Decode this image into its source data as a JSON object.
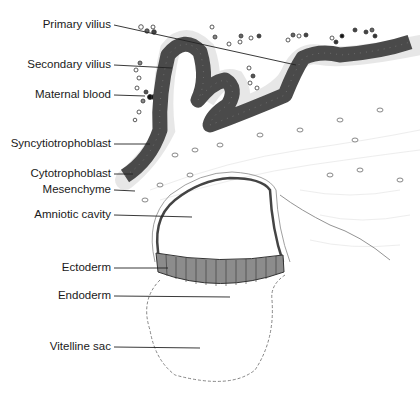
{
  "diagram": {
    "type": "anatomical-illustration",
    "colors": {
      "trophoblast_fill": "#4a4a4a",
      "ectoderm_fill": "#8c8c8c",
      "outline": "#222222",
      "background": "#ffffff",
      "cell_stroke": "#555555"
    },
    "labels": [
      {
        "id": "primary-vilius",
        "text": "Primary vilius",
        "right": 113,
        "y": 25,
        "line_to": [
          296,
          65
        ]
      },
      {
        "id": "secondary-vilius",
        "text": "Secondary vilius",
        "right": 113,
        "y": 65,
        "line_to": [
          172,
          68
        ]
      },
      {
        "id": "maternal-blood",
        "text": "Maternal blood",
        "right": 113,
        "y": 95,
        "line_to": [
          145,
          96
        ]
      },
      {
        "id": "syncytiotrophoblast",
        "text": "Syncytiotrophoblast",
        "right": 113,
        "y": 144,
        "line_to": [
          150,
          144
        ]
      },
      {
        "id": "cytotrophoblast",
        "text": "Cytotrophoblast",
        "right": 113,
        "y": 174,
        "line_to": [
          133,
          174
        ]
      },
      {
        "id": "mesenchyme",
        "text": "Mesenchyme",
        "right": 113,
        "y": 190,
        "line_to": [
          135,
          191
        ]
      },
      {
        "id": "amniotic-cavity",
        "text": "Amniotic cavity",
        "right": 113,
        "y": 215,
        "line_to": [
          192,
          217
        ]
      },
      {
        "id": "ectoderm",
        "text": "Ectoderm",
        "right": 113,
        "y": 268,
        "line_to": [
          168,
          268
        ]
      },
      {
        "id": "endoderm",
        "text": "Endoderm",
        "right": 113,
        "y": 296,
        "line_to": [
          230,
          297
        ]
      },
      {
        "id": "vitelline-sac",
        "text": "Vitelline sac",
        "right": 113,
        "y": 347,
        "line_to": [
          200,
          348
        ]
      }
    ]
  }
}
